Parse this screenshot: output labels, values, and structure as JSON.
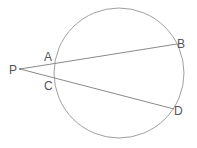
{
  "diagram": {
    "type": "geometry",
    "circle": {
      "cx": 119,
      "cy": 73,
      "r": 65
    },
    "points": {
      "P": {
        "label": "P",
        "x": 20,
        "y": 69
      },
      "A": {
        "label": "A",
        "x": 55,
        "y": 63
      },
      "B": {
        "label": "B",
        "x": 177,
        "y": 44
      },
      "C": {
        "label": "C",
        "x": 55,
        "y": 78
      },
      "D": {
        "label": "D",
        "x": 174,
        "y": 109
      }
    },
    "segments": [
      {
        "from": "P",
        "to": "B",
        "passes_through": "A"
      },
      {
        "from": "P",
        "to": "D",
        "passes_through": "C"
      }
    ],
    "colors": {
      "stroke": "#999999",
      "label": "#555555"
    }
  }
}
